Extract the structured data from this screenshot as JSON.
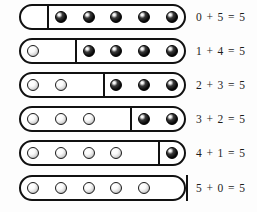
{
  "figure": {
    "total": 5,
    "bead_slots": 5,
    "colors": {
      "background": "#fdfdfd",
      "bar_outline": "#111111",
      "divider": "#111111",
      "dark_bead": "#000000",
      "light_bead": "#ffffff",
      "text": "#1c1c1c"
    }
  },
  "rows": [
    {
      "light_count": 0,
      "dark_count": 5,
      "divider_slot": 1,
      "equation": "0 + 5 = 5",
      "beads": [
        "dark",
        "dark",
        "dark",
        "dark",
        "dark"
      ]
    },
    {
      "light_count": 1,
      "dark_count": 4,
      "divider_slot": 2,
      "equation": "1 + 4 = 5",
      "beads": [
        "light",
        "dark",
        "dark",
        "dark",
        "dark"
      ]
    },
    {
      "light_count": 2,
      "dark_count": 3,
      "divider_slot": 3,
      "equation": "2 + 3 = 5",
      "beads": [
        "light",
        "light",
        "dark",
        "dark",
        "dark"
      ]
    },
    {
      "light_count": 3,
      "dark_count": 2,
      "divider_slot": 4,
      "equation": "3 + 2 = 5",
      "beads": [
        "light",
        "light",
        "light",
        "dark",
        "dark"
      ]
    },
    {
      "light_count": 4,
      "dark_count": 1,
      "divider_slot": 5,
      "equation": "4 + 1 = 5",
      "beads": [
        "light",
        "light",
        "light",
        "light",
        "dark"
      ]
    },
    {
      "light_count": 5,
      "dark_count": 0,
      "divider_slot": 6,
      "equation": "5 + 0 = 5",
      "beads": [
        "light",
        "light",
        "light",
        "light",
        "light"
      ]
    }
  ]
}
